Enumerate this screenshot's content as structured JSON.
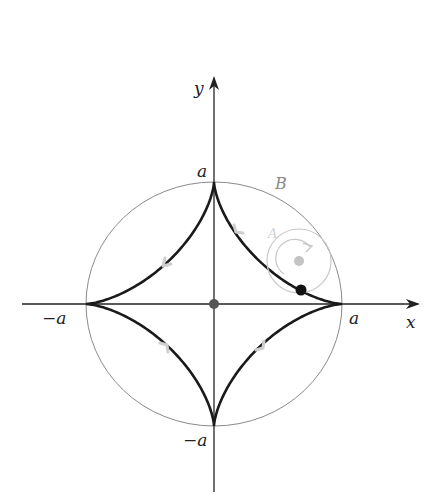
{
  "figure": {
    "center": {
      "x": 214,
      "y": 304
    },
    "radius_x": 128,
    "radius_y": 122,
    "axes": {
      "x_label": "x",
      "y_label": "y"
    },
    "ticks": {
      "pos_x": "a",
      "neg_x": "−a",
      "pos_y": "a",
      "neg_y": "−a"
    },
    "outer_circle_label": "B",
    "rolling_circle_label": "A",
    "rolling_circle": {
      "cx": 299,
      "cy": 261,
      "r": 32
    },
    "tracing_point": {
      "x": 301,
      "y": 290
    },
    "colors": {
      "astroid": "#1a1a1a",
      "axis": "#222222",
      "outer_circle": "#8a8a8a",
      "rolling_circle": "#c8c8c8",
      "center_dot": "#555555",
      "arrow_marks": "#cfcfcf"
    }
  }
}
